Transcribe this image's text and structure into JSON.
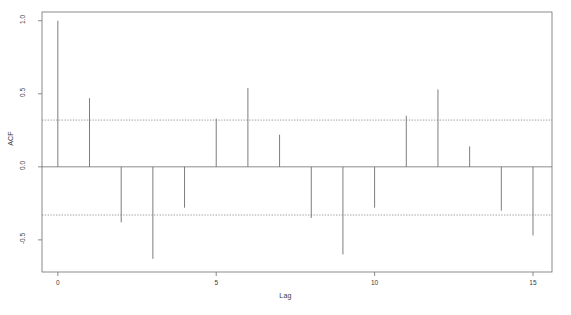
{
  "chart_data": {
    "type": "bar",
    "title": "",
    "subtitle": "",
    "xlabel": "Lag",
    "ylabel": "ACF",
    "categories": [
      0,
      1,
      2,
      3,
      4,
      5,
      6,
      7,
      8,
      9,
      10,
      11,
      12,
      13,
      14,
      15
    ],
    "values": [
      1.0,
      0.47,
      -0.38,
      -0.63,
      -0.28,
      0.33,
      0.54,
      0.22,
      -0.35,
      -0.6,
      -0.28,
      0.35,
      0.53,
      0.14,
      -0.3,
      -0.47
    ],
    "series": [
      {
        "name": "ACF",
        "values": [
          1.0,
          0.47,
          -0.38,
          -0.63,
          -0.28,
          0.33,
          0.54,
          0.22,
          -0.35,
          -0.6,
          -0.28,
          0.35,
          0.53,
          0.14,
          -0.3,
          -0.47
        ]
      }
    ],
    "xlim": [
      -0.5,
      15.6
    ],
    "ylim": [
      -0.72,
      1.06
    ],
    "xticks": [
      0,
      5,
      10,
      15
    ],
    "xtick_labels": [
      "0",
      "5",
      "10",
      "15"
    ],
    "yticks": [
      -0.5,
      0.0,
      0.5,
      1.0
    ],
    "ytick_labels": [
      "-0.5",
      "0.0",
      "0.5",
      "1.0"
    ],
    "grid": false,
    "legend": "none",
    "annotations": [
      {
        "name": "upper-confidence-band",
        "value": 0.32,
        "style": "dashed"
      },
      {
        "name": "lower-confidence-band",
        "value": -0.33,
        "style": "dashed"
      },
      {
        "name": "zero-line",
        "value": 0.0,
        "style": "solid"
      }
    ],
    "colors": {
      "spike": "#6e6e6e",
      "axis": "#6e6e6e",
      "confidence_band": "#7a7a7a",
      "text": "#3a3a3a",
      "background": "#ffffff"
    }
  }
}
